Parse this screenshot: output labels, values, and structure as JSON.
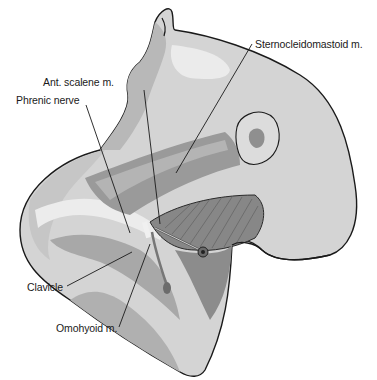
{
  "figure": {
    "colors": {
      "outline": "#1a1a1a",
      "skin_light": "#d8d8d8",
      "skin_mid": "#bdbdbd",
      "skin_dark": "#9e9e9e",
      "muscle": "#8a8a8a",
      "muscle_dark": "#6e6e6e",
      "highlight": "#ececec",
      "background": "#ffffff"
    },
    "labels": [
      {
        "id": "sternocleidomastoid",
        "text": "Sternocleidomastoid m."
      },
      {
        "id": "ant-scalene",
        "text": "Ant. scalene m."
      },
      {
        "id": "phrenic-nerve",
        "text": "Phrenic nerve"
      },
      {
        "id": "clavicle",
        "text": "Clavicle"
      },
      {
        "id": "omohyoid",
        "text": "Omohyoid m."
      }
    ]
  }
}
